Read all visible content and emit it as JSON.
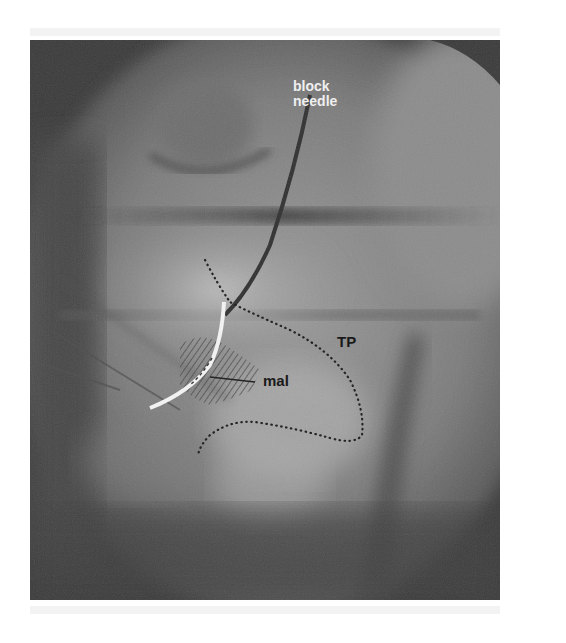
{
  "figure": {
    "kind": "fluoroscopic X-ray image",
    "colors": {
      "background": "#ffffff",
      "dark_field": "#3a3a3a",
      "soft_tissue": "#8a8a8a",
      "bone_light": "#b8b8b8",
      "electrode": "#f5f5f5",
      "outline_dots": "#1a1a1a"
    },
    "labels": {
      "needle_line1": "block",
      "needle_line2": "needle",
      "tp": "TP",
      "mal": "mal"
    }
  }
}
